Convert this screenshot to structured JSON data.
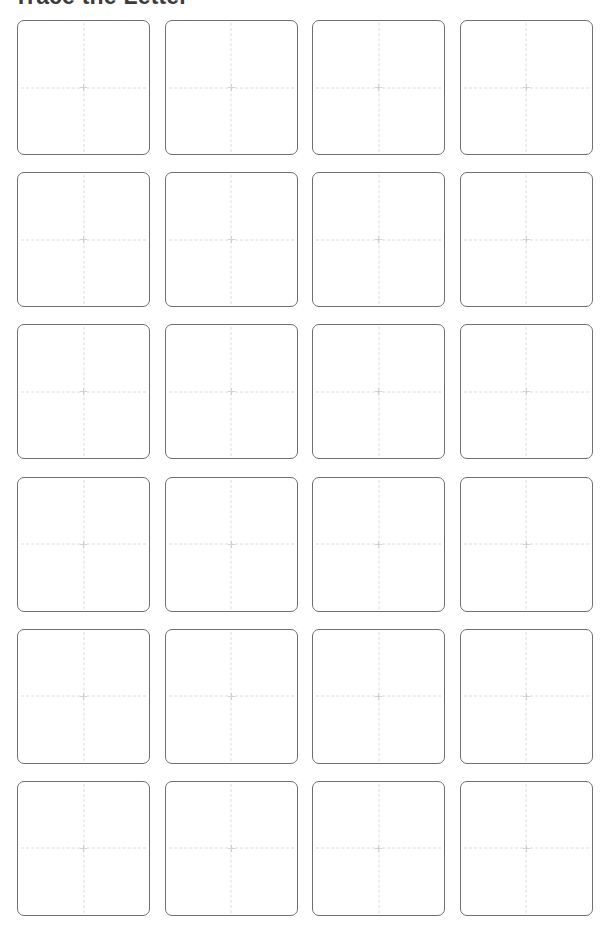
{
  "page": {
    "title": "Trace the Letter",
    "background_color": "#ffffff",
    "width": 616,
    "height": 936
  },
  "heading": {
    "text": "Trace the Letter",
    "color": "#3c3c3c",
    "clipped_at_top": true
  },
  "grid": {
    "columns": 4,
    "rows": 6,
    "cell_count": 24,
    "cell_border_color": "#6f6f6f",
    "cell_fill_color": "#ffffff",
    "guide_line_color": "#dcdcdc",
    "guide_line_style": "dashed",
    "cells": [
      {
        "id": "cell-1",
        "row": 1,
        "column": 1,
        "content": ""
      },
      {
        "id": "cell-2",
        "row": 1,
        "column": 2,
        "content": ""
      },
      {
        "id": "cell-3",
        "row": 1,
        "column": 3,
        "content": ""
      },
      {
        "id": "cell-4",
        "row": 1,
        "column": 4,
        "content": ""
      },
      {
        "id": "cell-5",
        "row": 2,
        "column": 1,
        "content": ""
      },
      {
        "id": "cell-6",
        "row": 2,
        "column": 2,
        "content": ""
      },
      {
        "id": "cell-7",
        "row": 2,
        "column": 3,
        "content": ""
      },
      {
        "id": "cell-8",
        "row": 2,
        "column": 4,
        "content": ""
      },
      {
        "id": "cell-9",
        "row": 3,
        "column": 1,
        "content": ""
      },
      {
        "id": "cell-10",
        "row": 3,
        "column": 2,
        "content": ""
      },
      {
        "id": "cell-11",
        "row": 3,
        "column": 3,
        "content": ""
      },
      {
        "id": "cell-12",
        "row": 3,
        "column": 4,
        "content": ""
      },
      {
        "id": "cell-13",
        "row": 4,
        "column": 1,
        "content": ""
      },
      {
        "id": "cell-14",
        "row": 4,
        "column": 2,
        "content": ""
      },
      {
        "id": "cell-15",
        "row": 4,
        "column": 3,
        "content": ""
      },
      {
        "id": "cell-16",
        "row": 4,
        "column": 4,
        "content": ""
      },
      {
        "id": "cell-17",
        "row": 5,
        "column": 1,
        "content": ""
      },
      {
        "id": "cell-18",
        "row": 5,
        "column": 2,
        "content": ""
      },
      {
        "id": "cell-19",
        "row": 5,
        "column": 3,
        "content": ""
      },
      {
        "id": "cell-20",
        "row": 5,
        "column": 4,
        "content": ""
      },
      {
        "id": "cell-21",
        "row": 6,
        "column": 1,
        "content": ""
      },
      {
        "id": "cell-22",
        "row": 6,
        "column": 2,
        "content": ""
      },
      {
        "id": "cell-23",
        "row": 6,
        "column": 3,
        "content": ""
      },
      {
        "id": "cell-24",
        "row": 6,
        "column": 4,
        "content": ""
      }
    ]
  }
}
